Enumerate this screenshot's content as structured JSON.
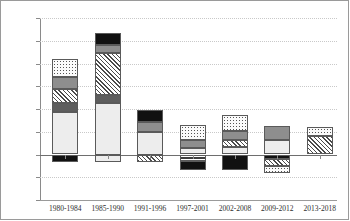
{
  "chart_data": {
    "type": "bar",
    "stacked": true,
    "title": "",
    "subtitle": "",
    "xlabel": "",
    "ylabel": "",
    "ylim": [
      -2.0,
      6.0
    ],
    "ytick_step": 1.0,
    "grid": true,
    "legend": "none",
    "categories": [
      "1980-1984",
      "1985-1990",
      "1991-1996",
      "1997-2001",
      "2002-2008",
      "2009-2012",
      "2013-2018"
    ],
    "ytick_labels": [
      "6.0",
      "5.0",
      "4.0",
      "3.0",
      "2.0",
      "1.0",
      "0.0",
      "- 1.0",
      "- 2.0"
    ],
    "ytick_values": [
      6.0,
      5.0,
      4.0,
      3.0,
      2.0,
      1.0,
      0.0,
      -1.0,
      -2.0
    ],
    "series": [
      {
        "name": "segment-light-gray",
        "pattern": "light-gray",
        "values": [
          1.85,
          2.3,
          1.0,
          0.3,
          0.35,
          0.65,
          0.0
        ]
      },
      {
        "name": "segment-dark-gray",
        "pattern": "dark-gray",
        "values": [
          0.4,
          0.4,
          0.0,
          0.0,
          0.0,
          0.0,
          0.0
        ]
      },
      {
        "name": "segment-hatched",
        "pattern": "diagonal-hatch",
        "values": [
          0.7,
          1.9,
          0.0,
          0.0,
          0.3,
          0.0,
          0.8
        ]
      },
      {
        "name": "segment-medium-gray",
        "pattern": "medium-gray",
        "values": [
          0.5,
          0.35,
          0.45,
          0.35,
          0.4,
          0.6,
          0.0
        ]
      },
      {
        "name": "segment-dotted",
        "pattern": "dotted",
        "values": [
          0.75,
          0.0,
          0.0,
          0.65,
          0.7,
          0.0,
          0.4
        ]
      },
      {
        "name": "segment-black",
        "pattern": "solid-black",
        "values": [
          0.0,
          0.5,
          0.5,
          0.0,
          0.0,
          0.0,
          0.0
        ]
      }
    ],
    "bar_totals_positive": [
      4.2,
      5.35,
      1.95,
      1.3,
      1.75,
      1.25,
      1.2
    ],
    "bar_totals_negative": [
      -0.1,
      -0.35,
      -0.35,
      -0.7,
      -0.7,
      -0.8,
      0.0
    ],
    "bars": [
      {
        "category": "1980-1984",
        "positive_segments": [
          {
            "pattern": "dotted",
            "from": 3.4,
            "to": 4.2,
            "value": 0.8
          },
          {
            "pattern": "medium-gray",
            "from": 2.9,
            "to": 3.4,
            "value": 0.5
          },
          {
            "pattern": "diagonal-hatch",
            "from": 2.25,
            "to": 2.9,
            "value": 0.65
          },
          {
            "pattern": "dark-gray",
            "from": 1.85,
            "to": 2.25,
            "value": 0.4
          },
          {
            "pattern": "light-gray",
            "from": 0.0,
            "to": 1.85,
            "value": 1.85
          }
        ],
        "negative_segments": [
          {
            "pattern": "solid-black",
            "from": -0.35,
            "to": 0.0,
            "value": -0.35
          }
        ]
      },
      {
        "category": "1985-1990",
        "positive_segments": [
          {
            "pattern": "solid-black",
            "from": 4.8,
            "to": 5.35,
            "value": 0.55
          },
          {
            "pattern": "medium-gray",
            "from": 4.45,
            "to": 4.8,
            "value": 0.35
          },
          {
            "pattern": "diagonal-hatch",
            "from": 2.6,
            "to": 4.45,
            "value": 1.85
          },
          {
            "pattern": "dark-gray",
            "from": 2.25,
            "to": 2.6,
            "value": 0.35
          },
          {
            "pattern": "light-gray",
            "from": 0.0,
            "to": 2.25,
            "value": 2.25
          }
        ],
        "negative_segments": [
          {
            "pattern": "light-gray",
            "from": -0.35,
            "to": 0.0,
            "value": -0.35
          }
        ]
      },
      {
        "category": "1991-1996",
        "positive_segments": [
          {
            "pattern": "solid-black",
            "from": 1.45,
            "to": 1.95,
            "value": 0.5
          },
          {
            "pattern": "medium-gray",
            "from": 1.0,
            "to": 1.45,
            "value": 0.45
          },
          {
            "pattern": "light-gray",
            "from": 0.0,
            "to": 1.0,
            "value": 1.0
          }
        ],
        "negative_segments": [
          {
            "pattern": "diagonal-hatch",
            "from": -0.35,
            "to": 0.0,
            "value": -0.35
          }
        ]
      },
      {
        "category": "1997-2001",
        "positive_segments": [
          {
            "pattern": "dotted",
            "from": 0.65,
            "to": 1.3,
            "value": 0.65
          },
          {
            "pattern": "medium-gray",
            "from": 0.3,
            "to": 0.65,
            "value": 0.35
          },
          {
            "pattern": "light-gray",
            "from": 0.0,
            "to": 0.3,
            "value": 0.3
          }
        ],
        "negative_segments": [
          {
            "pattern": "dashed-dark",
            "from": -0.3,
            "to": 0.0,
            "value": -0.3
          },
          {
            "pattern": "solid-black",
            "from": -0.7,
            "to": -0.3,
            "value": -0.4
          }
        ]
      },
      {
        "category": "2002-2008",
        "positive_segments": [
          {
            "pattern": "dotted",
            "from": 1.05,
            "to": 1.75,
            "value": 0.7
          },
          {
            "pattern": "medium-gray",
            "from": 0.65,
            "to": 1.05,
            "value": 0.4
          },
          {
            "pattern": "diagonal-hatch",
            "from": 0.35,
            "to": 0.65,
            "value": 0.3
          },
          {
            "pattern": "light-gray",
            "from": 0.0,
            "to": 0.35,
            "value": 0.35
          }
        ],
        "negative_segments": [
          {
            "pattern": "solid-black",
            "from": -0.7,
            "to": 0.0,
            "value": -0.7
          }
        ]
      },
      {
        "category": "2009-2012",
        "positive_segments": [
          {
            "pattern": "medium-gray",
            "from": 0.65,
            "to": 1.25,
            "value": 0.6
          },
          {
            "pattern": "light-gray",
            "from": 0.0,
            "to": 0.65,
            "value": 0.65
          }
        ],
        "negative_segments": [
          {
            "pattern": "solid-black",
            "from": -0.2,
            "to": 0.0,
            "value": -0.2
          },
          {
            "pattern": "diagonal-hatch",
            "from": -0.5,
            "to": -0.2,
            "value": -0.3
          },
          {
            "pattern": "dotted",
            "from": -0.8,
            "to": -0.5,
            "value": -0.3
          }
        ]
      },
      {
        "category": "2013-2018",
        "positive_segments": [
          {
            "pattern": "dotted",
            "from": 0.8,
            "to": 1.2,
            "value": 0.4
          },
          {
            "pattern": "diagonal-hatch",
            "from": 0.0,
            "to": 0.8,
            "value": 0.8
          }
        ],
        "negative_segments": []
      }
    ]
  }
}
